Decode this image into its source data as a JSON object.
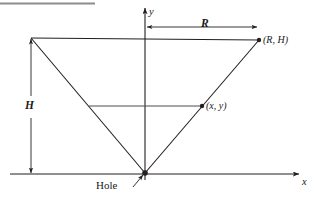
{
  "figure": {
    "width": 314,
    "height": 198,
    "background_color": "#ffffff",
    "line_color": "#231f20",
    "rule_color": "#808080"
  },
  "axes": {
    "x_label": "x",
    "y_label": "y",
    "x_axis": {
      "y": 174,
      "x_start": 10,
      "x_end": 300,
      "arrow": "right"
    },
    "y_axis": {
      "x": 145,
      "y_start": 180,
      "y_end": 7,
      "arrow": "up"
    }
  },
  "dimensions": [
    {
      "name": "radius",
      "label": "R",
      "orientation": "horizontal",
      "y": 27,
      "x_start": 146,
      "x_end": 258,
      "arrows": "both"
    },
    {
      "name": "height",
      "label": "H",
      "orientation": "vertical",
      "x": 31,
      "y_start": 38,
      "y_end": 174,
      "arrows": "both"
    }
  ],
  "points": [
    {
      "name": "rim-right",
      "label": "(R, H)",
      "x": 259,
      "y": 40,
      "marker": "dot"
    },
    {
      "name": "surface-point",
      "label": "(x, y)",
      "x": 202,
      "y": 106,
      "marker": "dot"
    },
    {
      "name": "hole",
      "label": "Hole",
      "x": 145,
      "y": 173,
      "marker": "dot"
    }
  ],
  "shapes": {
    "cone": {
      "name": "inverted-cone",
      "vertices": [
        [
          31,
          38
        ],
        [
          259,
          40
        ],
        [
          145,
          173
        ]
      ]
    },
    "water_surface": {
      "x_start": 89,
      "x_end": 202,
      "y": 106
    },
    "top_rule": {
      "x_start": 0,
      "x_end": 95,
      "y": 3
    }
  },
  "labels": {
    "y_axis": "y",
    "x_axis": "x",
    "radius": "R",
    "height": "H",
    "rim_point": "(R, H)",
    "surface_point": "(x, y)",
    "hole": "Hole"
  }
}
